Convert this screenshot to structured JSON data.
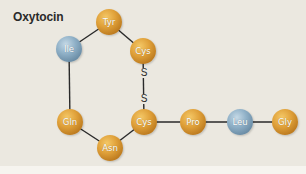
{
  "title": "Oxytocin",
  "colors": {
    "background": "#ebe8e0",
    "hydrophobic_node": "#8fb0c7",
    "other_node": "#e0a13a",
    "bond_line": "#2a2a2a"
  },
  "residues": [
    {
      "id": "tyr",
      "label": "Tyr",
      "color": "gold",
      "x": 109,
      "y": 22
    },
    {
      "id": "ile",
      "label": "Ile",
      "color": "blue",
      "x": 69,
      "y": 49
    },
    {
      "id": "cys1",
      "label": "Cys",
      "color": "gold",
      "x": 143,
      "y": 51
    },
    {
      "id": "gln",
      "label": "Gln",
      "color": "gold",
      "x": 70,
      "y": 122
    },
    {
      "id": "asn",
      "label": "Asn",
      "color": "gold",
      "x": 110,
      "y": 148
    },
    {
      "id": "cys6",
      "label": "Cys",
      "color": "gold",
      "x": 144,
      "y": 122
    },
    {
      "id": "pro",
      "label": "Pro",
      "color": "gold",
      "x": 193,
      "y": 122
    },
    {
      "id": "leu",
      "label": "Leu",
      "color": "blue",
      "x": 240,
      "y": 122
    },
    {
      "id": "gly",
      "label": "Gly",
      "color": "gold",
      "x": 285,
      "y": 122
    }
  ],
  "disulfide": {
    "atoms": [
      {
        "label": "S",
        "x": 144,
        "y": 73
      },
      {
        "label": "S",
        "x": 144,
        "y": 99
      }
    ]
  },
  "bonds": [
    [
      "tyr",
      "ile"
    ],
    [
      "tyr",
      "cys1"
    ],
    [
      "ile",
      "gln"
    ],
    [
      "gln",
      "asn"
    ],
    [
      "asn",
      "cys6"
    ],
    [
      "cys6",
      "pro"
    ],
    [
      "pro",
      "leu"
    ],
    [
      "leu",
      "gly"
    ],
    [
      "cys1",
      "cys6"
    ]
  ]
}
